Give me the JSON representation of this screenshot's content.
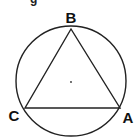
{
  "figure": {
    "type": "inscribed-equilateral-triangle",
    "colors": {
      "stroke": "#222222",
      "background": "#ffffff",
      "text": "#111111"
    },
    "circle": {
      "cx": 71,
      "cy": 81,
      "r": 55
    },
    "center_point": {
      "x": 71,
      "y": 82
    },
    "vertices": {
      "A": {
        "label": "A",
        "x": 120,
        "y": 108
      },
      "B": {
        "label": "B",
        "x": 71,
        "y": 29
      },
      "C": {
        "label": "C",
        "x": 25,
        "y": 108
      }
    },
    "labels": {
      "A": "A",
      "B": "B",
      "C": "C"
    },
    "cropped_fragment": "g"
  }
}
